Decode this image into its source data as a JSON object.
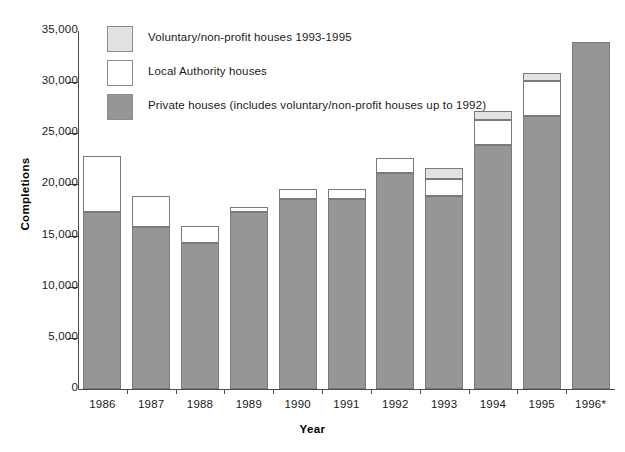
{
  "chart_data": {
    "type": "bar",
    "subtype": "stacked",
    "title": "",
    "xlabel": "Year",
    "ylabel": "Completions",
    "categories": [
      "1986",
      "1987",
      "1988",
      "1989",
      "1990",
      "1991",
      "1992",
      "1993",
      "1994",
      "1995",
      "1996*"
    ],
    "ylim": [
      0,
      35000
    ],
    "ytick_labels": [
      "35,000",
      "30,000",
      "25,000",
      "20,000",
      "15,000",
      "10,000",
      "5,000",
      "0"
    ],
    "ytick_values": [
      35000,
      30000,
      25000,
      20000,
      15000,
      10000,
      5000,
      0
    ],
    "ytick_step": 5000,
    "grid": false,
    "legend_position": "top-left",
    "series": [
      {
        "name": "Private houses (includes voluntary/non-profit houses up to 1992)",
        "color": "#969696",
        "values": [
          17300,
          15800,
          14250,
          17300,
          18600,
          18600,
          21100,
          18900,
          23850,
          26650,
          33900
        ]
      },
      {
        "name": "Local Authority houses",
        "color": "#ffffff",
        "values": [
          5450,
          3050,
          1650,
          500,
          1000,
          1000,
          1450,
          1600,
          2450,
          3450,
          0
        ]
      },
      {
        "name": "Voluntary/non-profit houses 1993-1995",
        "color": "#e2e2e2",
        "values": [
          0,
          0,
          0,
          0,
          0,
          0,
          0,
          1100,
          850,
          800,
          0
        ]
      }
    ],
    "totals": [
      22750,
      18850,
      15900,
      17800,
      19600,
      19600,
      22550,
      21600,
      27150,
      30900,
      33900
    ]
  },
  "legend": {
    "items": [
      {
        "label": "Voluntary/non-profit houses 1993-1995",
        "color": "#e2e2e2"
      },
      {
        "label": "Local Authority houses",
        "color": "#ffffff"
      },
      {
        "label": "Private houses (includes voluntary/non-profit houses up to 1992)",
        "color": "#969696"
      }
    ]
  },
  "axes": {
    "y_title": "Completions",
    "x_title": "Year"
  }
}
